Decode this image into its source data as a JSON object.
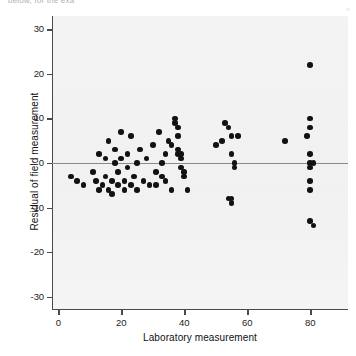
{
  "figure": {
    "clipped_header": "below, for the exa",
    "corner_mark": "»"
  },
  "chart_data": {
    "type": "scatter",
    "title": "",
    "xlabel": "Laboratory measurement",
    "ylabel": "Residual of field measurement",
    "xlim": [
      -2,
      92
    ],
    "ylim": [
      -33,
      33
    ],
    "xticks": [
      0,
      20,
      40,
      60,
      80
    ],
    "yticks": [
      30,
      20,
      10,
      0,
      -10,
      -20,
      -30
    ],
    "grid": false,
    "legend": null,
    "reference_line": {
      "type": "horizontal",
      "y": 0,
      "color": "#8a8a8a"
    },
    "marker": {
      "shape": "circle",
      "color": "#121212",
      "size": 5.6
    },
    "points": [
      [
        4,
        -3
      ],
      [
        6,
        -4
      ],
      [
        8,
        -5
      ],
      [
        11,
        -2
      ],
      [
        12,
        -4
      ],
      [
        13,
        -6
      ],
      [
        13,
        2
      ],
      [
        14,
        -5
      ],
      [
        15,
        -3
      ],
      [
        15,
        1
      ],
      [
        16,
        -6
      ],
      [
        16,
        5
      ],
      [
        17,
        -4
      ],
      [
        17,
        -7
      ],
      [
        18,
        0
      ],
      [
        18,
        3
      ],
      [
        19,
        -5
      ],
      [
        19,
        -2
      ],
      [
        20,
        7
      ],
      [
        20,
        1
      ],
      [
        21,
        -4
      ],
      [
        21,
        -6
      ],
      [
        22,
        2
      ],
      [
        22,
        -1
      ],
      [
        23,
        -5
      ],
      [
        23,
        6
      ],
      [
        24,
        -3
      ],
      [
        25,
        0
      ],
      [
        25,
        -6
      ],
      [
        26,
        3
      ],
      [
        27,
        -4
      ],
      [
        28,
        1
      ],
      [
        29,
        -5
      ],
      [
        30,
        4
      ],
      [
        31,
        -2
      ],
      [
        32,
        7
      ],
      [
        33,
        0
      ],
      [
        34,
        -4
      ],
      [
        35,
        5
      ],
      [
        36,
        -6
      ],
      [
        37,
        9
      ],
      [
        37,
        10
      ],
      [
        38,
        8
      ],
      [
        38,
        6
      ],
      [
        38,
        3
      ],
      [
        38,
        2
      ],
      [
        39,
        2
      ],
      [
        39,
        1
      ],
      [
        39,
        -1
      ],
      [
        40,
        -2
      ],
      [
        40,
        -3
      ],
      [
        41,
        -6
      ],
      [
        36,
        4
      ],
      [
        34,
        2
      ],
      [
        33,
        -3
      ],
      [
        31,
        -5
      ],
      [
        52,
        5
      ],
      [
        53,
        9
      ],
      [
        54,
        8
      ],
      [
        55,
        6
      ],
      [
        55,
        2
      ],
      [
        56,
        0
      ],
      [
        56,
        -1
      ],
      [
        54,
        -8
      ],
      [
        55,
        -8
      ],
      [
        55,
        -9
      ],
      [
        57,
        6
      ],
      [
        50,
        4
      ],
      [
        72,
        5
      ],
      [
        80,
        22
      ],
      [
        80,
        10
      ],
      [
        80,
        8
      ],
      [
        79,
        6
      ],
      [
        80,
        2
      ],
      [
        80,
        0
      ],
      [
        81,
        0
      ],
      [
        80,
        -1
      ],
      [
        80,
        -4
      ],
      [
        80,
        -6
      ],
      [
        80,
        -13
      ],
      [
        81,
        -14
      ]
    ]
  }
}
